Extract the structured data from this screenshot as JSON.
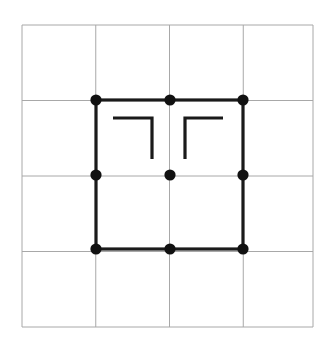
{
  "canvas": {
    "width": 330,
    "height": 352,
    "background": "#ffffff"
  },
  "diagram": {
    "colors": {
      "grid_line": "#a8a8a8",
      "bold_line": "#1a1a1a",
      "vertex_fill": "#111111",
      "mark_line": "#1a1a1a",
      "background": "#ffffff"
    },
    "grid": {
      "name": "lattice",
      "rows": 4,
      "cols": 4,
      "x_start": 22,
      "y_start": 25,
      "x_end": 313,
      "y_end": 327,
      "x_lines": [
        22,
        95.75,
        169.5,
        243.25,
        313
      ],
      "y_lines": [
        25,
        100.5,
        176,
        251.5,
        327
      ],
      "line_width": 1
    },
    "bold_square": {
      "name": "highlighted-square",
      "x": 96,
      "y": 100,
      "width": 147,
      "height": 149,
      "line_width": 3.2,
      "spans_cells": "2 x 2"
    },
    "vertices": [
      {
        "id": "v-top-left",
        "x": 96,
        "y": 100,
        "r": 5.6
      },
      {
        "id": "v-top-mid",
        "x": 170,
        "y": 100,
        "r": 5.6
      },
      {
        "id": "v-top-right",
        "x": 243,
        "y": 100,
        "r": 5.6
      },
      {
        "id": "v-mid-left",
        "x": 96,
        "y": 175,
        "r": 5.6
      },
      {
        "id": "v-center",
        "x": 170,
        "y": 175,
        "r": 5.6
      },
      {
        "id": "v-mid-right",
        "x": 243,
        "y": 175,
        "r": 5.6
      },
      {
        "id": "v-bottom-left",
        "x": 96,
        "y": 249,
        "r": 5.6
      },
      {
        "id": "v-bottom-mid",
        "x": 170,
        "y": 249,
        "r": 5.6
      },
      {
        "id": "v-bottom-right",
        "x": 243,
        "y": 249,
        "r": 5.6
      }
    ],
    "corner_marks": [
      {
        "id": "mark-left-upper-right-corner",
        "shape": "corner-bracket-top-right",
        "points": "113,118 152,118 152,159",
        "line_width": 3.2
      },
      {
        "id": "mark-right-upper-left-corner",
        "shape": "corner-bracket-top-left",
        "points": "185,159 185,118 223,118",
        "line_width": 3.2
      }
    ]
  }
}
